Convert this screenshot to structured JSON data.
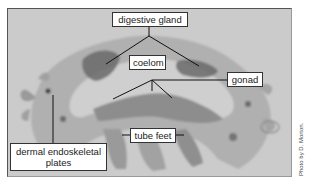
{
  "figure": {
    "type": "labeled micrograph",
    "labels": {
      "digestive_gland": "digestive gland",
      "coelom": "coelom",
      "gonad": "gonad",
      "tube_feet": "tube feet",
      "dermal_plates_line1": "dermal endoskeletal",
      "dermal_plates_line2": "plates"
    },
    "credit": "Photo by D. Morton."
  },
  "colors": {
    "background": "#c9c9c9",
    "tissue": "#8a8a8a",
    "tissue_dark": "#5e5e5e",
    "leader_line": "#111111",
    "label_bg": "#ffffff"
  }
}
